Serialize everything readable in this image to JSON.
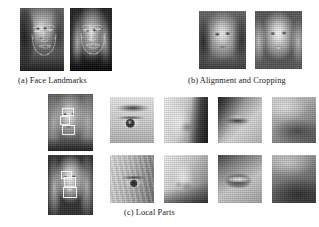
{
  "figure": {
    "background_color": "#fefefe",
    "caption_color": "#1a1a1a",
    "overlay_color": "#ffffff"
  },
  "panels": [
    {
      "id": "a",
      "caption": "(a) Face Landmarks",
      "images": [
        {
          "name": "landmark-face-left",
          "description": "grayscale portrait of woman with hand near face, landmark mesh overlay",
          "tone": "mid-gray",
          "has_landmarks": true,
          "has_bbox": false
        },
        {
          "name": "landmark-face-right",
          "description": "grayscale portrait of smiling blonde woman on dark background, landmark mesh overlay",
          "tone": "dark",
          "has_landmarks": true,
          "has_bbox": false
        }
      ]
    },
    {
      "id": "b",
      "caption": "(b) Alignment and Cropping",
      "images": [
        {
          "name": "aligned-face-left",
          "description": "aligned and cropped grayscale face, neutral expression",
          "tone": "mid-gray",
          "has_landmarks": false,
          "has_bbox": false
        },
        {
          "name": "aligned-face-right",
          "description": "aligned and cropped grayscale face, smiling with teeth",
          "tone": "light",
          "has_landmarks": false,
          "has_bbox": false
        }
      ]
    },
    {
      "id": "c",
      "caption": "(c) Local Parts",
      "source_images": [
        {
          "name": "local-parts-source-top",
          "description": "portrait with white part bounding boxes on eye, nose and mouth",
          "tone": "mid-gray",
          "has_landmarks": false,
          "has_bbox": true
        },
        {
          "name": "local-parts-source-bottom",
          "description": "smiling portrait with white part bounding boxes on eye, nose and mouth",
          "tone": "dark",
          "has_landmarks": false,
          "has_bbox": true
        }
      ],
      "part_grid": {
        "rows": 2,
        "columns": 4,
        "part_labels": [
          "eye",
          "nose",
          "mouth",
          "chin"
        ],
        "tiles": [
          [
            {
              "name": "part-eye-row1",
              "part": "eye",
              "description": "close-up of right eye and eyebrow",
              "tone": "light"
            },
            {
              "name": "part-nose-row1",
              "part": "nose",
              "description": "close-up of nose and cheek",
              "tone": "light"
            },
            {
              "name": "part-mouth-row1",
              "part": "mouth",
              "description": "close-up of closed lips and chin",
              "tone": "mid-gray"
            },
            {
              "name": "part-chin-row1",
              "part": "chin",
              "description": "close-up of jawline and neck",
              "tone": "mid-gray"
            }
          ],
          [
            {
              "name": "part-eye-row2",
              "part": "eye",
              "description": "close-up of eye with hair strands",
              "tone": "mid-gray"
            },
            {
              "name": "part-nose-row2",
              "part": "nose",
              "description": "close-up of nose, three-quarter view",
              "tone": "light"
            },
            {
              "name": "part-mouth-row2",
              "part": "mouth",
              "description": "close-up of smiling mouth with teeth",
              "tone": "mid-gray"
            },
            {
              "name": "part-chin-row2",
              "part": "chin",
              "description": "close-up of chin and neck shadow",
              "tone": "dark"
            }
          ]
        ]
      }
    }
  ]
}
